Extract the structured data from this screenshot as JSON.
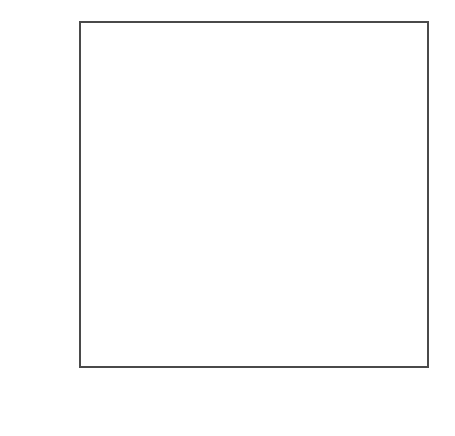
{
  "figure": {
    "background_color": "#ffffff",
    "axis_color": "#4a4a4a",
    "line_color": "#2e2e2e",
    "label_color": "#555555",
    "corner_mark": ""
  },
  "chart_data": {
    "type": "line",
    "title": "",
    "subtitle": "",
    "xlabel": "YEAR",
    "ylabel": "CO2 CONCENTRATION (PPM)",
    "ylabel_parts": {
      "prefix": "CO",
      "subscript": "2",
      "suffix": " CONCENTRATION  (PPM)"
    },
    "xlim": [
      1958.9,
      1981.0
    ],
    "ylim": [
      0,
      354.5
    ],
    "xticks": [
      1960,
      1965,
      1970,
      1975,
      1980
    ],
    "xtick_labels": [
      "1960",
      "1965",
      "1970",
      "1975",
      "1980"
    ],
    "yticks": [
      0,
      100,
      200,
      300
    ],
    "ytick_labels": [
      "0",
      "100",
      "200",
      "300"
    ],
    "yticks_minor": [
      50,
      150,
      250,
      350
    ],
    "grid": false,
    "legend": null,
    "axis_frame": "box",
    "tick_direction": "in",
    "series": [
      {
        "name": "Atmospheric CO2 (Mauna Loa monthly mean)",
        "x": [
          1958.96,
          1959.04,
          1959.12,
          1959.21,
          1959.29,
          1959.38,
          1959.46,
          1959.54,
          1959.62,
          1959.71,
          1959.79,
          1959.88,
          1959.96,
          1960.04,
          1960.12,
          1960.21,
          1960.29,
          1960.38,
          1960.46,
          1960.54,
          1960.62,
          1960.71,
          1960.79,
          1960.88,
          1960.96,
          1961.04,
          1961.12,
          1961.21,
          1961.29,
          1961.38,
          1961.46,
          1961.54,
          1961.62,
          1961.71,
          1961.79,
          1961.88,
          1961.96,
          1962.04,
          1962.12,
          1962.21,
          1962.29,
          1962.38,
          1962.46,
          1962.54,
          1962.62,
          1962.71,
          1962.79,
          1962.88,
          1962.96,
          1963.04,
          1963.12,
          1963.21,
          1963.29,
          1963.38,
          1963.46,
          1963.54,
          1963.62,
          1963.71,
          1963.79,
          1963.88,
          1963.96,
          1964.04,
          1964.12,
          1964.21,
          1964.29,
          1964.38,
          1964.46,
          1964.54,
          1964.62,
          1964.71,
          1964.79,
          1964.88,
          1964.96,
          1965.04,
          1965.12,
          1965.21,
          1965.29,
          1965.38,
          1965.46,
          1965.54,
          1965.62,
          1965.71,
          1965.79,
          1965.88,
          1965.96,
          1966.04,
          1966.12,
          1966.21,
          1966.29,
          1966.38,
          1966.46,
          1966.54,
          1966.62,
          1966.71,
          1966.79,
          1966.88,
          1966.96,
          1967.04,
          1967.12,
          1967.21,
          1967.29,
          1967.38,
          1967.46,
          1967.54,
          1967.62,
          1967.71,
          1967.79,
          1967.88,
          1967.96,
          1968.04,
          1968.12,
          1968.21,
          1968.29,
          1968.38,
          1968.46,
          1968.54,
          1968.62,
          1968.71,
          1968.79,
          1968.88,
          1968.96,
          1969.04,
          1969.12,
          1969.21,
          1969.29,
          1969.38,
          1969.46,
          1969.54,
          1969.62,
          1969.71,
          1969.79,
          1969.88,
          1969.96,
          1970.04,
          1970.12,
          1970.21,
          1970.29,
          1970.38,
          1970.46,
          1970.54,
          1970.62,
          1970.71,
          1970.79,
          1970.88,
          1970.96,
          1971.04,
          1971.12,
          1971.21,
          1971.29,
          1971.38,
          1971.46,
          1971.54,
          1971.62,
          1971.71,
          1971.79,
          1971.88,
          1971.96,
          1972.04,
          1972.12,
          1972.21,
          1972.29,
          1972.38,
          1972.46,
          1972.54,
          1972.62,
          1972.71,
          1972.79,
          1972.88,
          1972.96,
          1973.04,
          1973.12,
          1973.21,
          1973.29,
          1973.38,
          1973.46,
          1973.54,
          1973.62,
          1973.71,
          1973.79,
          1973.88,
          1973.96,
          1974.04,
          1974.12,
          1974.21,
          1974.29,
          1974.38,
          1974.46,
          1974.54,
          1974.62,
          1974.71,
          1974.79,
          1974.88,
          1974.96,
          1975.04,
          1975.12,
          1975.21,
          1975.29,
          1975.38,
          1975.46,
          1975.54,
          1975.62,
          1975.71,
          1975.79,
          1975.88,
          1975.96,
          1976.04,
          1976.12,
          1976.21,
          1976.29,
          1976.38,
          1976.46,
          1976.54,
          1976.62,
          1976.71,
          1976.79,
          1976.88,
          1976.96,
          1977.04,
          1977.12,
          1977.21,
          1977.29,
          1977.38,
          1977.46,
          1977.54,
          1977.62,
          1977.71,
          1977.79,
          1977.88,
          1977.96,
          1978.04,
          1978.12,
          1978.21,
          1978.29,
          1978.38,
          1978.46,
          1978.54,
          1978.62,
          1978.71,
          1978.79,
          1978.88,
          1978.96,
          1979.04,
          1979.12,
          1979.21,
          1979.29,
          1979.38,
          1979.46,
          1979.54,
          1979.62,
          1979.71,
          1979.79,
          1979.88,
          1979.96,
          1980.04,
          1980.12,
          1980.21,
          1980.29,
          1980.38,
          1980.46,
          1980.54,
          1980.62,
          1980.71
        ],
        "y": [
          315.4,
          316.2,
          316.8,
          317.6,
          318.2,
          317.8,
          316.5,
          314.9,
          313.4,
          313.2,
          314.4,
          315.6,
          316.3,
          316.9,
          317.6,
          318.5,
          319.0,
          318.4,
          317.0,
          315.3,
          314.0,
          313.6,
          314.8,
          316.1,
          316.8,
          317.3,
          318.0,
          318.8,
          319.4,
          318.9,
          317.6,
          316.0,
          314.5,
          314.2,
          315.3,
          316.5,
          317.2,
          317.7,
          318.4,
          319.2,
          319.8,
          319.3,
          318.0,
          316.4,
          314.9,
          314.7,
          315.8,
          317.0,
          317.7,
          318.1,
          318.8,
          319.6,
          320.3,
          319.8,
          318.5,
          316.9,
          315.4,
          315.1,
          316.2,
          317.4,
          318.1,
          318.7,
          319.4,
          320.3,
          320.9,
          320.4,
          319.1,
          317.5,
          316.0,
          315.7,
          316.8,
          318.0,
          318.8,
          319.3,
          320.1,
          321.0,
          321.6,
          321.1,
          319.8,
          318.1,
          316.6,
          316.3,
          317.5,
          318.8,
          319.6,
          320.2,
          321.0,
          322.0,
          322.7,
          322.2,
          320.9,
          319.2,
          317.7,
          317.4,
          318.6,
          319.9,
          320.7,
          321.3,
          322.1,
          323.1,
          323.8,
          323.3,
          322.0,
          320.3,
          318.8,
          318.5,
          319.7,
          321.0,
          321.8,
          322.3,
          323.1,
          324.1,
          324.9,
          324.4,
          323.1,
          321.4,
          319.8,
          319.5,
          320.8,
          322.2,
          323.0,
          323.6,
          324.5,
          325.6,
          326.4,
          325.9,
          324.6,
          322.8,
          321.2,
          320.9,
          322.2,
          323.6,
          324.5,
          325.1,
          326.0,
          327.0,
          327.8,
          327.3,
          326.0,
          324.2,
          322.6,
          322.3,
          323.6,
          325.0,
          325.9,
          326.4,
          327.2,
          328.2,
          329.0,
          328.5,
          327.2,
          325.4,
          323.8,
          323.5,
          324.8,
          326.2,
          327.1,
          327.7,
          328.6,
          329.7,
          330.6,
          330.1,
          328.7,
          326.9,
          325.3,
          325.0,
          326.4,
          327.9,
          328.9,
          329.5,
          330.5,
          331.6,
          332.5,
          332.0,
          330.6,
          328.8,
          327.1,
          326.8,
          328.2,
          329.7,
          330.7,
          331.2,
          332.1,
          333.2,
          334.0,
          333.5,
          332.1,
          330.3,
          328.7,
          328.4,
          329.8,
          331.3,
          332.2,
          332.7,
          333.6,
          334.6,
          335.4,
          334.9,
          333.5,
          331.7,
          330.1,
          329.8,
          331.2,
          332.7,
          333.6,
          334.1,
          335.0,
          336.1,
          336.9,
          336.4,
          335.0,
          333.2,
          331.5,
          331.2,
          332.6,
          334.1,
          335.1,
          335.7,
          336.7,
          337.8,
          338.6,
          338.1,
          336.7,
          334.9,
          333.2,
          332.9,
          334.3,
          335.8,
          336.8,
          337.4,
          338.4,
          339.5,
          340.4,
          339.9,
          338.5,
          336.6,
          334.9,
          334.6,
          336.0,
          337.6,
          338.6,
          339.2,
          340.2,
          341.3,
          342.2,
          341.7,
          340.3,
          338.4,
          336.7,
          336.4,
          337.8,
          339.4,
          340.4,
          341.0,
          342.0,
          343.1,
          344.0,
          343.5,
          342.1,
          340.2,
          338.5,
          338.2
        ]
      }
    ]
  }
}
